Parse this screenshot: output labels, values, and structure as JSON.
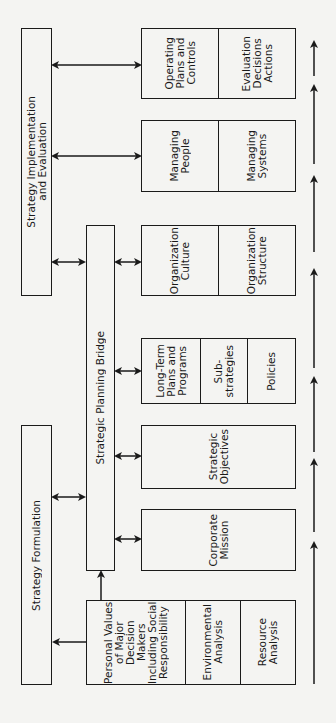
{
  "diagram": {
    "orientation": "rotated 90deg counter-clockwise",
    "main_phases": {
      "implementation": "Strategy Implementation\nand Evaluation",
      "formulation": "Strategy Formulation",
      "bridge": "Strategic Planning Bridge"
    },
    "blocks": [
      {
        "id": "inputs",
        "cells": [
          "Personal Values\nof Major\nDecision Makers\nIncluding Social\nResponsibility",
          "Environmental\nAnalysis",
          "Resource\nAnalysis"
        ]
      },
      {
        "id": "mission",
        "cells": [
          "Corporate\nMission"
        ]
      },
      {
        "id": "objectives",
        "cells": [
          "Strategic\nObjectives"
        ]
      },
      {
        "id": "plans",
        "cells": [
          "Long-Term\nPlans and\nPrograms",
          "Sub-\nstrategies",
          "Policies"
        ]
      },
      {
        "id": "organization",
        "cells": [
          "Organization\nCulture",
          "Organization\nStructure"
        ]
      },
      {
        "id": "managing",
        "cells": [
          "Managing\nPeople",
          "Managing\nSystems"
        ]
      },
      {
        "id": "operating",
        "cells": [
          "Operating\nPlans and\nControls",
          "Evaluation\nDecisions\nActions"
        ]
      }
    ],
    "flow_direction": "inputs → operating (upward arrows along right edge)"
  }
}
